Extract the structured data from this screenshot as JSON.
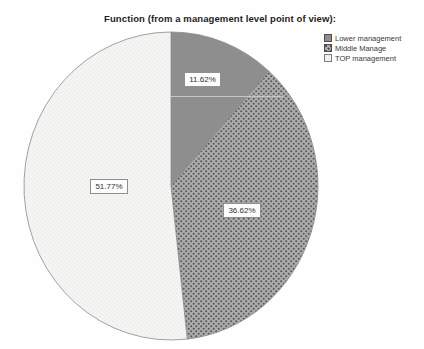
{
  "title": "Function (from a management level point of view):",
  "legend": {
    "items": [
      {
        "label": "Lower management"
      },
      {
        "label": "Middle Manage"
      },
      {
        "label": "TOP management"
      }
    ]
  },
  "chart_data": {
    "type": "pie",
    "title": "Function (from a management level point of view):",
    "start_angle_deg": 0,
    "direction": "clockwise",
    "legend_position": "top-right",
    "slices": [
      {
        "label": "Lower management",
        "value": 11.62,
        "display": "11.62%",
        "fill_style": "solid-gray"
      },
      {
        "label": "Middle Manage",
        "value": 36.62,
        "display": "36.62%",
        "fill_style": "dark-dots"
      },
      {
        "label": "TOP management",
        "value": 51.77,
        "display": "51.77%",
        "fill_style": "light-dots"
      }
    ],
    "colors": {
      "solid_gray": "#8e8e8e",
      "dots_bg": "#acacac",
      "dots_fg": "#585858",
      "light_bg": "#f5f5f3",
      "light_fg": "#dededc",
      "outline": "#8a8a8a",
      "label_border": "#8f8f8f",
      "label_bg": "#fcfcfc",
      "text": "#333333"
    }
  }
}
